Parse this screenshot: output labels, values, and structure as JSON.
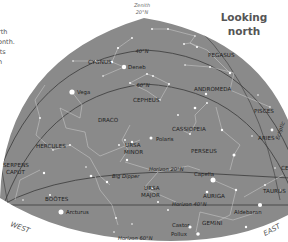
{
  "header": {
    "title_line1": "Looking",
    "title_line2": "north"
  },
  "side_text": [
    "rth",
    "onth.",
    "its",
    "n"
  ],
  "zenith": {
    "label": "Zenith",
    "lat": "20°N"
  },
  "altitude_lines": {
    "lat40": "40°N",
    "lat60": "60°N",
    "horizon20": "Horizon 20°N",
    "horizon40": "Horizon 40°N",
    "horizon60": "Horizon 60°N",
    "ecliptic": "Ecliptic"
  },
  "directions": {
    "west": "WEST",
    "east": "EAST"
  },
  "constellations": [
    {
      "name": "CYGNUS"
    },
    {
      "name": "PEGASUS"
    },
    {
      "name": "ANDROMEDA"
    },
    {
      "name": "CEPHEUS"
    },
    {
      "name": "PISCES"
    },
    {
      "name": "DRACO"
    },
    {
      "name": "CASSIOPEIA"
    },
    {
      "name": "ARIES"
    },
    {
      "name": "HERCULES"
    },
    {
      "name": "URSA"
    },
    {
      "name": "MINOR"
    },
    {
      "name": "PERSEUS"
    },
    {
      "name": "SERPENS"
    },
    {
      "name": "CAPUT"
    },
    {
      "name": "BOÖTES"
    },
    {
      "name": "URSA"
    },
    {
      "name": "MAJOR"
    },
    {
      "name": "AURIGA"
    },
    {
      "name": "TAURUS"
    },
    {
      "name": "GEMINI"
    },
    {
      "name": "CET"
    }
  ],
  "stars": {
    "deneb": "Deneb",
    "vega": "Vega",
    "polaris": "Polaris",
    "capella": "Capella",
    "arcturus": "Arcturus",
    "aldebaran": "Aldebaran",
    "castor": "Castor",
    "pollux": "Pollux",
    "big_dipper": "Big Dipper"
  },
  "colors": {
    "sky": "#8a8a8a",
    "line": "#3a3a3a",
    "star": "#ffffff",
    "figure": "#d8d8d8",
    "text": "#1e1e1e"
  }
}
